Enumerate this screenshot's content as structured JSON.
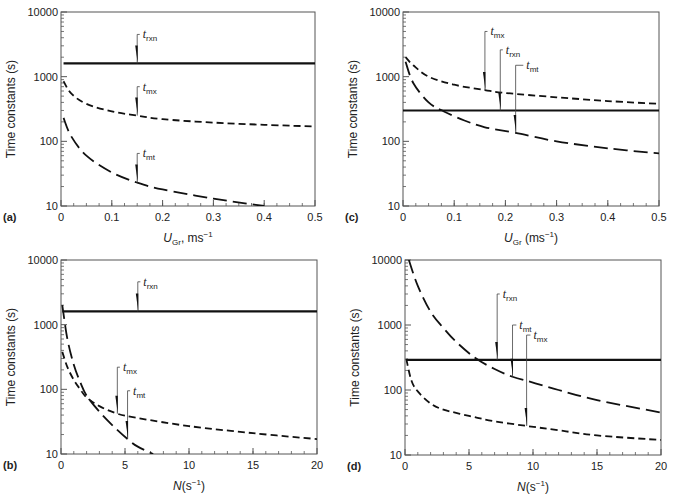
{
  "chart_data": [
    {
      "panel": "(a)",
      "type": "line",
      "xlabel": "U_Gr, ms-1",
      "xlabel_main": "U",
      "xlabel_sub": "Gr",
      "xlabel_rest": ", ms",
      "xlabel_sup": "−1",
      "ylabel": "Time constants (s)",
      "yscale": "log",
      "ylim": [
        10,
        10000
      ],
      "xlim": [
        0,
        0.5
      ],
      "xticks": [
        0,
        0.1,
        0.2,
        0.3,
        0.4,
        0.5
      ],
      "xtick_labels": [
        "0",
        "0.1",
        "0.2",
        "0.3",
        "0.4",
        "0.5"
      ],
      "yticks": [
        10,
        100,
        1000,
        10000
      ],
      "ytick_labels": [
        "10",
        "100",
        "1000",
        "10000"
      ],
      "box": {
        "x0": 61,
        "x1": 315,
        "y0": 12,
        "y1": 206
      },
      "series": [
        {
          "name": "t_rxn",
          "style": "solid",
          "x": [
            0.005,
            0.5
          ],
          "values": [
            1600,
            1600
          ]
        },
        {
          "name": "t_mx",
          "style": "short-dash",
          "x": [
            0.005,
            0.02,
            0.05,
            0.1,
            0.15,
            0.2,
            0.3,
            0.4,
            0.5
          ],
          "values": [
            850,
            550,
            380,
            290,
            250,
            220,
            195,
            180,
            170
          ]
        },
        {
          "name": "t_mt",
          "style": "long-dash",
          "x": [
            0.005,
            0.02,
            0.05,
            0.1,
            0.15,
            0.2,
            0.3,
            0.4
          ],
          "values": [
            230,
            120,
            60,
            33,
            23,
            18,
            13,
            10
          ]
        }
      ],
      "annotations": [
        {
          "label": "t",
          "sub": "rxn",
          "x": 0.15,
          "y": 1600,
          "tx": 0.155,
          "ty": 4500
        },
        {
          "label": "t",
          "sub": "mx",
          "x": 0.15,
          "y": 250,
          "tx": 0.155,
          "ty": 700
        },
        {
          "label": "t",
          "sub": "mt",
          "x": 0.15,
          "y": 23,
          "tx": 0.155,
          "ty": 65
        }
      ]
    },
    {
      "panel": "(c)",
      "type": "line",
      "xlabel": "U_Gr (ms-1)",
      "xlabel_main": "U",
      "xlabel_sub": "Gr",
      "xlabel_rest": " (ms",
      "xlabel_sup": "−1",
      "xlabel_end": ")",
      "ylabel": "Time constants (s)",
      "yscale": "log",
      "ylim": [
        10,
        10000
      ],
      "xlim": [
        0,
        0.5
      ],
      "xticks": [
        0,
        0.1,
        0.2,
        0.3,
        0.4,
        0.5
      ],
      "xtick_labels": [
        "0",
        "0.1",
        "0.2",
        "0.3",
        "0.4",
        "0.5"
      ],
      "yticks": [
        10,
        100,
        1000,
        10000
      ],
      "ytick_labels": [
        "10",
        "100",
        "1000",
        "10000"
      ],
      "box": {
        "x0": 403,
        "x1": 659,
        "y0": 12,
        "y1": 206
      },
      "series": [
        {
          "name": "t_rxn",
          "style": "solid",
          "x": [
            0.0,
            0.5
          ],
          "values": [
            300,
            300
          ]
        },
        {
          "name": "t_mx",
          "style": "short-dash",
          "x": [
            0.005,
            0.02,
            0.05,
            0.1,
            0.16,
            0.2,
            0.3,
            0.4,
            0.5
          ],
          "values": [
            2000,
            1500,
            1000,
            750,
            620,
            560,
            480,
            420,
            380
          ]
        },
        {
          "name": "t_mt",
          "style": "long-dash",
          "x": [
            0.005,
            0.02,
            0.05,
            0.08,
            0.12,
            0.16,
            0.22,
            0.3,
            0.4,
            0.5
          ],
          "values": [
            1700,
            800,
            400,
            290,
            210,
            165,
            135,
            100,
            78,
            65
          ]
        }
      ],
      "annotations": [
        {
          "label": "t",
          "sub": "mx",
          "x": 0.16,
          "y": 620,
          "tx": 0.165,
          "ty": 5000
        },
        {
          "label": "t",
          "sub": "rxn",
          "x": 0.19,
          "y": 300,
          "tx": 0.195,
          "ty": 2600
        },
        {
          "label": "t",
          "sub": "mt",
          "x": 0.22,
          "y": 135,
          "tx": 0.235,
          "ty": 1500
        }
      ]
    },
    {
      "panel": "(b)",
      "type": "line",
      "xlabel": "N(s-1)",
      "xlabel_main": "N",
      "xlabel_sub": "",
      "xlabel_rest": "(s",
      "xlabel_sup": "−1",
      "xlabel_end": ")",
      "ylabel": "Time constants (s)",
      "yscale": "log",
      "ylim": [
        10,
        10000
      ],
      "xlim": [
        0,
        20
      ],
      "xticks": [
        0,
        5,
        10,
        15,
        20
      ],
      "xtick_labels": [
        "0",
        "5",
        "10",
        "15",
        "20"
      ],
      "yticks": [
        10,
        100,
        1000,
        10000
      ],
      "ytick_labels": [
        "10",
        "100",
        "1000",
        "10000"
      ],
      "box": {
        "x0": 61,
        "x1": 317,
        "y0": 260,
        "y1": 454
      },
      "series": [
        {
          "name": "t_rxn",
          "style": "solid",
          "x": [
            0.1,
            20
          ],
          "values": [
            1600,
            1600
          ]
        },
        {
          "name": "t_mx",
          "style": "short-dash",
          "x": [
            0.1,
            0.5,
            1,
            1.5,
            2,
            3,
            4.4,
            6,
            10,
            15,
            20
          ],
          "values": [
            380,
            220,
            140,
            100,
            75,
            55,
            42,
            36,
            27,
            21,
            17
          ]
        },
        {
          "name": "t_mt",
          "style": "long-dash",
          "x": [
            0.1,
            0.5,
            1,
            1.5,
            2,
            3,
            4,
            5.2,
            6,
            7.2
          ],
          "values": [
            2000,
            600,
            240,
            130,
            80,
            45,
            28,
            17,
            13,
            10
          ]
        }
      ],
      "annotations": [
        {
          "label": "t",
          "sub": "rxn",
          "x": 6.0,
          "y": 1600,
          "tx": 6.2,
          "ty": 4600
        },
        {
          "label": "t",
          "sub": "mx",
          "x": 4.4,
          "y": 42,
          "tx": 4.6,
          "ty": 220
        },
        {
          "label": "t",
          "sub": "mt",
          "x": 5.2,
          "y": 17,
          "tx": 5.4,
          "ty": 95
        }
      ]
    },
    {
      "panel": "(d)",
      "type": "line",
      "xlabel": "N(s-1)",
      "xlabel_main": "N",
      "xlabel_sub": "",
      "xlabel_rest": "(s",
      "xlabel_sup": "−1",
      "xlabel_end": ")",
      "ylabel": "Time constants (s)",
      "yscale": "log",
      "ylim": [
        10,
        10000
      ],
      "xlim": [
        0,
        20
      ],
      "xticks": [
        0,
        5,
        10,
        15,
        20
      ],
      "xtick_labels": [
        "0",
        "5",
        "10",
        "15",
        "20"
      ],
      "yticks": [
        10,
        100,
        1000,
        10000
      ],
      "ytick_labels": [
        "10",
        "100",
        "1000",
        "10000"
      ],
      "box": {
        "x0": 405,
        "x1": 661,
        "y0": 260,
        "y1": 455
      },
      "series": [
        {
          "name": "t_rxn",
          "style": "solid",
          "x": [
            0.1,
            20
          ],
          "values": [
            290,
            290
          ]
        },
        {
          "name": "t_mx",
          "style": "short-dash",
          "x": [
            0.1,
            0.5,
            1,
            2,
            3,
            5,
            7,
            9.5,
            12,
            15,
            20
          ],
          "values": [
            300,
            140,
            95,
            62,
            50,
            40,
            33,
            28,
            24,
            20,
            17
          ]
        },
        {
          "name": "t_mt",
          "style": "long-dash",
          "x": [
            0.3,
            1,
            2,
            3,
            4,
            5.5,
            7,
            8.4,
            10,
            12,
            15,
            20
          ],
          "values": [
            10000,
            4000,
            1600,
            900,
            550,
            310,
            210,
            160,
            130,
            100,
            70,
            45
          ]
        }
      ],
      "annotations": [
        {
          "label": "t",
          "sub": "rxn",
          "x": 7.2,
          "y": 290,
          "tx": 7.4,
          "ty": 3000
        },
        {
          "label": "t",
          "sub": "mt",
          "x": 8.4,
          "y": 160,
          "tx": 8.7,
          "ty": 1000
        },
        {
          "label": "t",
          "sub": "mx",
          "x": 9.5,
          "y": 28,
          "tx": 9.8,
          "ty": 700
        }
      ]
    }
  ]
}
